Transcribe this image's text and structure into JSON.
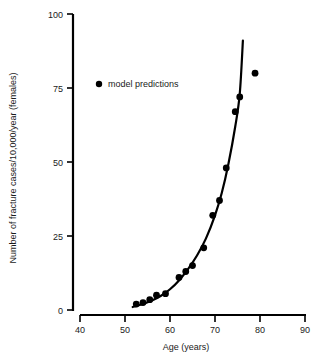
{
  "chart_data": {
    "type": "scatter",
    "title": "",
    "xlabel": "Age (years)",
    "ylabel": "Number of fracture cases/10,000/year (females)",
    "xlim": [
      40,
      90
    ],
    "ylim": [
      0,
      100
    ],
    "xticks": [
      "40",
      "50",
      "60",
      "70",
      "80",
      "90"
    ],
    "yticks": [
      "0",
      "25",
      "50",
      "75",
      "100"
    ],
    "grid": false,
    "legend_position": "upper-left-inside",
    "legend": [
      {
        "label": "model predictions",
        "marker": "filled-circle",
        "color": "#000000"
      }
    ],
    "series": [
      {
        "name": "model predictions",
        "marker": "filled-circle",
        "color": "#000000",
        "points": [
          {
            "x": 52.5,
            "y": 2.0
          },
          {
            "x": 54.0,
            "y": 2.5
          },
          {
            "x": 55.5,
            "y": 3.5
          },
          {
            "x": 57.0,
            "y": 5.0
          },
          {
            "x": 59.0,
            "y": 5.5
          },
          {
            "x": 62.0,
            "y": 11.0
          },
          {
            "x": 63.5,
            "y": 13.0
          },
          {
            "x": 65.0,
            "y": 15.0
          },
          {
            "x": 67.5,
            "y": 21.0
          },
          {
            "x": 69.5,
            "y": 32.0
          },
          {
            "x": 71.0,
            "y": 37.0
          },
          {
            "x": 72.5,
            "y": 48.0
          },
          {
            "x": 74.5,
            "y": 67.0
          },
          {
            "x": 75.5,
            "y": 72.0
          },
          {
            "x": 78.9,
            "y": 80.0
          }
        ]
      },
      {
        "name": "fitted curve",
        "marker": "none",
        "color": "#000000",
        "points": [
          {
            "x": 51.7,
            "y": 1.0
          },
          {
            "x": 54.0,
            "y": 2.0
          },
          {
            "x": 56.0,
            "y": 3.2
          },
          {
            "x": 58.0,
            "y": 4.8
          },
          {
            "x": 60.0,
            "y": 7.0
          },
          {
            "x": 62.0,
            "y": 10.0
          },
          {
            "x": 64.0,
            "y": 13.8
          },
          {
            "x": 66.0,
            "y": 18.4
          },
          {
            "x": 68.0,
            "y": 24.2
          },
          {
            "x": 70.0,
            "y": 32.0
          },
          {
            "x": 71.5,
            "y": 39.5
          },
          {
            "x": 73.0,
            "y": 49.5
          },
          {
            "x": 74.5,
            "y": 62.0
          },
          {
            "x": 75.5,
            "y": 73.0
          },
          {
            "x": 76.2,
            "y": 91.0
          }
        ]
      }
    ]
  },
  "axes": {
    "x_axis_name": "x-axis",
    "y_axis_name": "y-axis"
  }
}
